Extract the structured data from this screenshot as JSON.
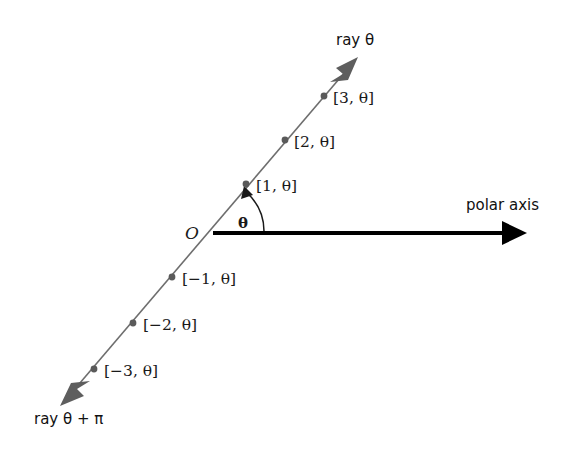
{
  "figure": {
    "background_color": "#ffffff",
    "ray_color": "#6e6e6e",
    "point_color": "#5a5a5a",
    "axis_color": "#000000",
    "arc_color": "#1a1a1a",
    "text_color": "#111111"
  },
  "origin": {
    "label": "O",
    "x": 213,
    "y": 233
  },
  "angle": {
    "label": "θ",
    "x": 243,
    "y": 222
  },
  "polar_axis": {
    "label": "polar axis",
    "label_x": 466,
    "label_y": 210,
    "start_x": 213,
    "start_y": 233,
    "end_x": 527,
    "end_y": 233
  },
  "ray_positive": {
    "label": "ray θ",
    "label_x": 336,
    "label_y": 45,
    "tip_x": 358,
    "tip_y": 57
  },
  "ray_negative": {
    "label": "ray θ + π",
    "label_x": 34,
    "label_y": 424,
    "tip_x": 60,
    "tip_y": 406
  },
  "points": [
    {
      "label": "[3, θ]",
      "px": 324,
      "py": 96,
      "lx": 333,
      "ly": 103
    },
    {
      "label": "[2, θ]",
      "px": 285,
      "py": 140,
      "lx": 294,
      "ly": 147
    },
    {
      "label": "[1, θ]",
      "px": 246,
      "py": 184,
      "lx": 256,
      "ly": 191
    },
    {
      "label": "[−1, θ]",
      "px": 172,
      "py": 277,
      "lx": 182,
      "ly": 284
    },
    {
      "label": "[−2, θ]",
      "px": 133,
      "py": 323,
      "lx": 143,
      "ly": 330
    },
    {
      "label": "[−3, θ]",
      "px": 94,
      "py": 369,
      "lx": 104,
      "ly": 376
    }
  ]
}
